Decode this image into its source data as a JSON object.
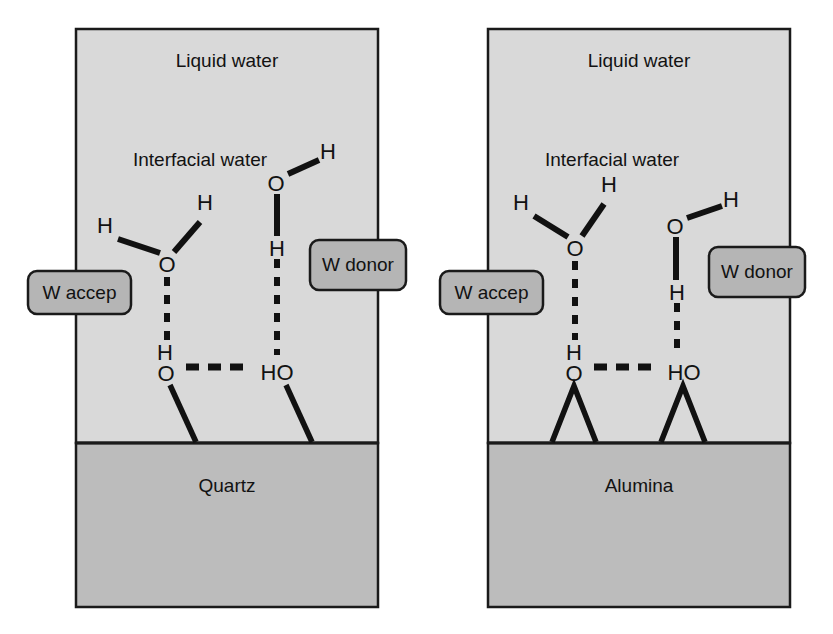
{
  "figure": {
    "type": "schematic-diagram",
    "colors": {
      "water_region_fill": "#d9d9d9",
      "substrate_fill": "#bcbcbc",
      "callout_fill": "#b5b5b5",
      "stroke": "#1a1a1a",
      "text": "#121212",
      "page_background": "#ffffff"
    }
  },
  "panels": [
    {
      "id": "quartz-panel",
      "bulk_label": "Liquid water",
      "interfacial_label": "Interfacial water",
      "substrate_label": "Quartz",
      "callouts": [
        {
          "id": "w-accep",
          "label": "W accep"
        },
        {
          "id": "w-donor",
          "label": "W donor"
        }
      ],
      "atoms": [
        {
          "id": "accep-h-left",
          "label": "H",
          "x": 105,
          "y": 233
        },
        {
          "id": "accep-h-right",
          "label": "H",
          "x": 205,
          "y": 210
        },
        {
          "id": "accep-o",
          "label": "O",
          "x": 167,
          "y": 264
        },
        {
          "id": "donor-o",
          "label": "O",
          "x": 276,
          "y": 183
        },
        {
          "id": "donor-h-upper",
          "label": "H",
          "x": 328,
          "y": 152
        },
        {
          "id": "donor-h-lower",
          "label": "H",
          "x": 277,
          "y": 248
        },
        {
          "id": "surface-h-left",
          "label": "H",
          "x": 165,
          "y": 352
        },
        {
          "id": "surface-o-left",
          "label": "O",
          "x": 166,
          "y": 373
        },
        {
          "id": "surface-ho-right",
          "label": "HO",
          "x": 277,
          "y": 372
        }
      ]
    },
    {
      "id": "alumina-panel",
      "bulk_label": "Liquid water",
      "interfacial_label": "Interfacial water",
      "substrate_label": "Alumina",
      "callouts": [
        {
          "id": "w-accep",
          "label": "W accep"
        },
        {
          "id": "w-donor",
          "label": "W donor"
        }
      ],
      "atoms": [
        {
          "id": "accep-h-left",
          "label": "H",
          "x": 521,
          "y": 210
        },
        {
          "id": "accep-h-right",
          "label": "H",
          "x": 609,
          "y": 192
        },
        {
          "id": "accep-o",
          "label": "O",
          "x": 575,
          "y": 248
        },
        {
          "id": "donor-o",
          "label": "O",
          "x": 675,
          "y": 226
        },
        {
          "id": "donor-h-upper",
          "label": "H",
          "x": 731,
          "y": 200
        },
        {
          "id": "donor-h-lower",
          "label": "H",
          "x": 677,
          "y": 292
        },
        {
          "id": "surface-h-left",
          "label": "H",
          "x": 574,
          "y": 352
        },
        {
          "id": "surface-o-left",
          "label": "O",
          "x": 574,
          "y": 373
        },
        {
          "id": "surface-ho-right",
          "label": "HO",
          "x": 684,
          "y": 372
        }
      ]
    }
  ]
}
